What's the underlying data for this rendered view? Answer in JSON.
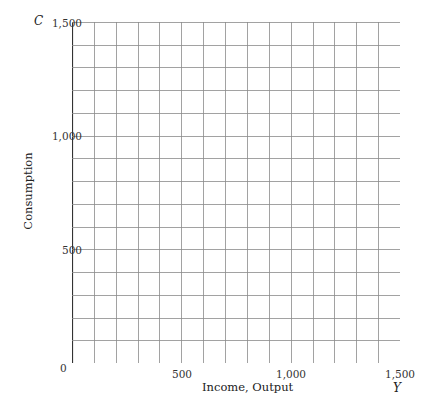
{
  "chart_data": {
    "type": "line",
    "title": "",
    "xlabel": "Income, Output",
    "ylabel": "Consumption",
    "x_symbol": "Y",
    "y_symbol": "C",
    "xlim": [
      0,
      1500
    ],
    "ylim": [
      0,
      1500
    ],
    "x_ticks": [
      "0",
      "500",
      "1,000",
      "1,500"
    ],
    "y_ticks": [
      "500",
      "1,000",
      "1,500"
    ],
    "grid": true,
    "grid_step": 100,
    "series": []
  },
  "colors": {
    "grid": "#8a8a8a",
    "axis": "#333333"
  }
}
